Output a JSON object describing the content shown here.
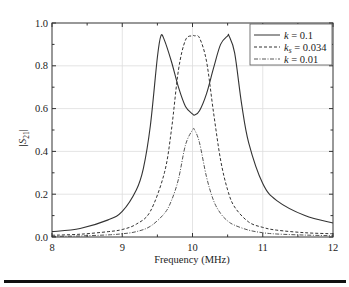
{
  "chart_data": {
    "type": "line",
    "title": "",
    "xlabel": "Frequency (MHz)",
    "ylabel": "|S21|",
    "xlim": [
      8,
      12
    ],
    "ylim": [
      0.0,
      1.0
    ],
    "xticks": [
      8,
      9,
      10,
      11,
      12
    ],
    "xtick_labels": [
      "8",
      "9",
      "10",
      "11",
      "12"
    ],
    "yticks": [
      0.0,
      0.2,
      0.4,
      0.6,
      0.8,
      1.0
    ],
    "ytick_labels": [
      "0.0",
      "0.2",
      "0.4",
      "0.6",
      "0.8",
      "1.0"
    ],
    "grid": true,
    "legend_position": "upper right",
    "series": [
      {
        "name": "k = 0.1",
        "style": "solid",
        "x": [
          8.0,
          8.4,
          8.8,
          9.0,
          9.2,
          9.3,
          9.4,
          9.5,
          9.55,
          9.6,
          9.7,
          9.8,
          9.9,
          10.0,
          10.03,
          10.1,
          10.2,
          10.3,
          10.4,
          10.5,
          10.52,
          10.6,
          10.7,
          10.8,
          11.0,
          11.2,
          11.6,
          12.0
        ],
        "values": [
          0.025,
          0.04,
          0.08,
          0.12,
          0.22,
          0.32,
          0.52,
          0.84,
          0.94,
          0.92,
          0.82,
          0.7,
          0.61,
          0.575,
          0.57,
          0.59,
          0.67,
          0.79,
          0.9,
          0.94,
          0.94,
          0.86,
          0.62,
          0.44,
          0.25,
          0.17,
          0.1,
          0.065
        ]
      },
      {
        "name": "k_s = 0.034",
        "style": "dashed",
        "x": [
          8.0,
          8.4,
          8.8,
          9.0,
          9.2,
          9.4,
          9.6,
          9.7,
          9.8,
          9.9,
          10.0,
          10.03,
          10.1,
          10.2,
          10.3,
          10.4,
          10.5,
          10.6,
          10.8,
          11.0,
          11.2,
          11.6,
          12.0
        ],
        "values": [
          0.008,
          0.013,
          0.025,
          0.035,
          0.06,
          0.12,
          0.3,
          0.5,
          0.78,
          0.92,
          0.94,
          0.94,
          0.93,
          0.82,
          0.58,
          0.36,
          0.22,
          0.14,
          0.07,
          0.045,
          0.032,
          0.02,
          0.015
        ]
      },
      {
        "name": "k = 0.01",
        "style": "dash-dot",
        "x": [
          8.0,
          8.4,
          8.8,
          9.0,
          9.2,
          9.4,
          9.6,
          9.7,
          9.8,
          9.9,
          10.0,
          10.03,
          10.1,
          10.2,
          10.3,
          10.4,
          10.5,
          10.6,
          10.8,
          11.0,
          11.2,
          11.6,
          12.0
        ],
        "values": [
          0.003,
          0.005,
          0.01,
          0.015,
          0.025,
          0.05,
          0.11,
          0.17,
          0.27,
          0.43,
          0.5,
          0.5,
          0.44,
          0.28,
          0.17,
          0.11,
          0.075,
          0.055,
          0.032,
          0.02,
          0.014,
          0.009,
          0.006
        ]
      }
    ]
  },
  "legend": {
    "items": [
      {
        "var": "k",
        "sub": "",
        "eq": " = 0.1",
        "style": "solid"
      },
      {
        "var": "k",
        "sub": "s",
        "eq": " = 0.034",
        "style": "dashed"
      },
      {
        "var": "k",
        "sub": "",
        "eq": " = 0.01",
        "style": "dash-dot"
      }
    ]
  },
  "axes": {
    "xlabel": "Frequency (MHz)",
    "ylabel_main": "|S",
    "ylabel_sub": "21",
    "ylabel_end": "|"
  }
}
